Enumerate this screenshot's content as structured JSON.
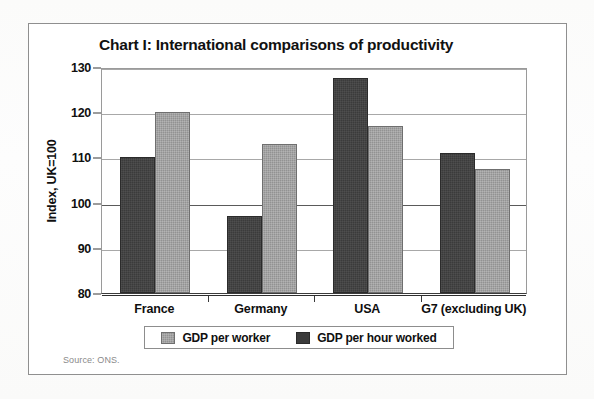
{
  "figure": {
    "title": "Chart I: International comparisons of productivity",
    "source_note": "Source: ONS."
  },
  "chart_data": {
    "type": "bar",
    "title": "Chart I: International comparisons of productivity",
    "xlabel": "",
    "ylabel": "Index, UK=100",
    "ylim": [
      80,
      130
    ],
    "ytick_step": 10,
    "yticks": [
      80,
      90,
      100,
      110,
      120,
      130
    ],
    "ytick_labels": [
      "80",
      "90",
      "100",
      "110",
      "120",
      "130"
    ],
    "grid": true,
    "grid_axis": "y",
    "legend_position": "bottom",
    "categories": [
      "France",
      "Germany",
      "USA",
      "G7 (excluding UK)"
    ],
    "series": [
      {
        "name": "GDP per hour worked",
        "color": "#3b3b3b",
        "values": [
          110,
          97,
          127.5,
          111
        ]
      },
      {
        "name": "GDP per worker",
        "color": "#929292",
        "values": [
          120,
          113,
          117,
          107.5
        ]
      }
    ],
    "series_draw_order": [
      "GDP per hour worked",
      "GDP per worker"
    ],
    "annotations": [
      "Source: ONS."
    ]
  },
  "axis": {
    "y_title": "Index, UK=100"
  },
  "legend": {
    "items": [
      {
        "label": "GDP per worker",
        "swatch": "light"
      },
      {
        "label": "GDP per hour worked",
        "swatch": "dark"
      }
    ]
  },
  "colors": {
    "dark_series": "#3b3b3b",
    "light_series": "#929292",
    "frame": "#8f8f8f",
    "grid": "#a8a8a8",
    "text": "#101010"
  }
}
